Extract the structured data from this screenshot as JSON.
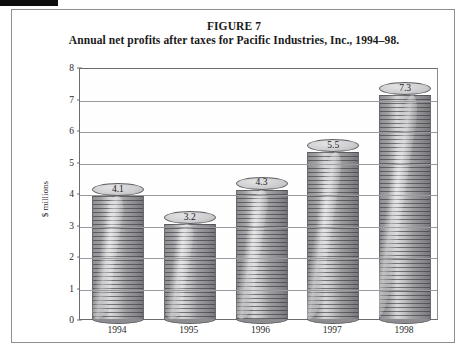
{
  "figure": {
    "caption_line1": "FIGURE 7",
    "caption_line2": "Annual net profits after taxes for Pacific Industries, Inc., 1994–98."
  },
  "chart_data": {
    "type": "bar",
    "title": "Annual net profits after taxes for Pacific Industries, Inc., 1994–98.",
    "figure_label": "FIGURE 7",
    "categories": [
      "1994",
      "1995",
      "1996",
      "1997",
      "1998"
    ],
    "values": [
      4.1,
      3.2,
      4.3,
      5.5,
      7.3
    ],
    "value_labels": [
      "4.1",
      "3.2",
      "4.3",
      "5.5",
      "7.3"
    ],
    "xlabel": "",
    "ylabel": "$ millions",
    "ylim": [
      0,
      8
    ],
    "ytick_labels": [
      "8",
      "7",
      "6",
      "5",
      "4",
      "3",
      "2",
      "1",
      "0"
    ],
    "ytick_values": [
      8,
      7,
      6,
      5,
      4,
      3,
      2,
      1,
      0
    ],
    "grid": true,
    "legend": false,
    "bar_style": "stacked-disc-cylinder",
    "colors": {
      "bar_fill": "#a8a8ac",
      "bar_outline": "#5f5f63",
      "gridline": "#9a9a9e",
      "axis": "#6b6b70",
      "text": "#1a1a1a",
      "background": "#ffffff"
    }
  }
}
